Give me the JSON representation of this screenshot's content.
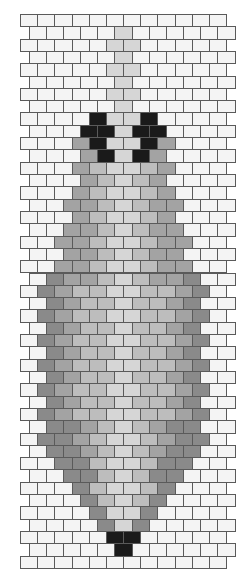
{
  "pattern": {
    "title": "Brick stitch bead pattern",
    "rows": 45,
    "bricks_per_row": 12,
    "geometry": {
      "top": 14,
      "row_height": 12.31,
      "brick_width": 17.17,
      "even_row_left": 20,
      "odd_row_left": 28.6
    },
    "palette": {
      "W": "#f4f4f4",
      "a": "#d6d6d6",
      "b": "#bdbdbd",
      "c": "#a3a3a3",
      "d": "#8a8a8a",
      "K": "#1a1a1a"
    },
    "row_codes": [
      "WWWWWWWWWWWW",
      "WWWWWaWWWWWW",
      "WWWWWaaWWWWW",
      "WWWWWaWWWWWW",
      "WWWWWaaWWWWW",
      "WWWWWaWWWWWW",
      "WWWWWaaWWWWW",
      "WWWWWaWWWWWW",
      "WWWWKaaKWWWW",
      "WWWKKaKKWWWW",
      "WWWcKaaKcWWW",
      "WWWcKaKcWWWW",
      "WWWcbaabcWWW",
      "WWWcbabcWWWW",
      "WWWcbaabcWWW",
      "WWccbabccWWW",
      "WWWcbaabcWWW",
      "WWccbabccWWW",
      "WWccbaabccWW",
      "WWccbabccWWW",
      "WWccbaabccWW",
      "WdccbabccdWW",
      "WdcbbaabbcdW",
      "WdcbbabbcdWW",
      "WdcbbaabbcdW",
      "WdcbbabbcdWW",
      "WdcbbaabbcdW",
      "WdcbbabbcdWW",
      "WdcbbaabbcdW",
      "WdcbbabbcdWW",
      "WdcbbaabbcdW",
      "WdcbbabbcdWW",
      "WdcbbaabbcdW",
      "WddcbabcddWW",
      "WddcbaabcddW",
      "WddcbabcddWW",
      "WWddbaabddWW",
      "WWddbabddWWW",
      "WWWdbaabdWWW",
      "WWWdbabdWWWW",
      "WWWWdaadWWWW",
      "WWWWdadWWWWW",
      "WWWWWKKWWWWW",
      "WWWWWKWWWWWW",
      "WWWWWWWWWWWW"
    ]
  }
}
